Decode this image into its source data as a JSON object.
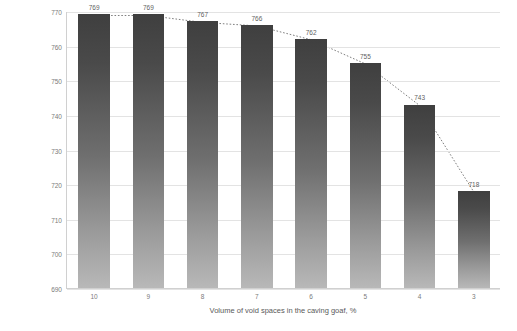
{
  "chart_data": {
    "type": "bar",
    "title": "",
    "subtitle": "",
    "xlabel": "Volume of void spaces in the caving goaf, %",
    "ylabel": "Volume of airflow migrating through the caving goaf, m³/min",
    "categories": [
      "10",
      "9",
      "8",
      "7",
      "6",
      "5",
      "4",
      "3"
    ],
    "values": [
      769,
      769,
      767,
      766,
      762,
      755,
      743,
      718
    ],
    "data_labels": [
      "769",
      "769",
      "767",
      "766",
      "762",
      "755",
      "743",
      "718"
    ],
    "series": [
      {
        "name": "Volume of airflow",
        "type": "bar",
        "values": [
          769,
          769,
          767,
          766,
          762,
          755,
          743,
          718
        ]
      },
      {
        "name": "Trend",
        "type": "line",
        "style": "dotted",
        "values": [
          769,
          769,
          767,
          766,
          762,
          755,
          743,
          718
        ]
      }
    ],
    "ylim": [
      690,
      770
    ],
    "yticks": [
      690,
      700,
      710,
      720,
      730,
      740,
      750,
      760,
      770
    ],
    "ytick_labels": [
      "690",
      "700",
      "710",
      "720",
      "730",
      "740",
      "750",
      "760",
      "770"
    ],
    "grid": "horizontal",
    "legend": "none",
    "colors": {
      "bar_top": "#3f3f3f",
      "bar_bottom": "#b8b8b8",
      "gridline": "#e3e3e3",
      "axis": "#d0d0d0",
      "tick_text": "#7b7b7b",
      "label_text": "#5f5f5f",
      "axis_title_text": "#595959",
      "trend_line": "#808080",
      "background": "#ffffff"
    }
  }
}
